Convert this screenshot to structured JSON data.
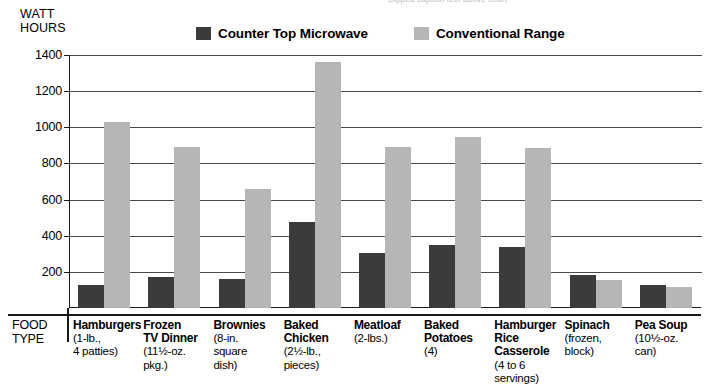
{
  "top_caption": "clipped caption text above chart",
  "axis_title": {
    "line1": "WATT",
    "line2": "HOURS"
  },
  "legend": {
    "entries": [
      {
        "label": "Counter Top Microwave",
        "color": "#3b3b3b",
        "key": "microwave"
      },
      {
        "label": "Conventional Range",
        "color": "#b6b6b6",
        "key": "range"
      }
    ]
  },
  "yaxis": {
    "ticks": [
      "1400",
      "1200",
      "1000",
      "800",
      "600",
      "400",
      "200"
    ],
    "min": 0,
    "max": 1400
  },
  "xaxis": {
    "corner_line1": "FOOD",
    "corner_line2": "TYPE"
  },
  "chart_data": {
    "type": "bar",
    "title": "WATT HOURS",
    "xlabel": "FOOD TYPE",
    "ylabel": "WATT HOURS",
    "ylim": [
      0,
      1400
    ],
    "grid": true,
    "legend_position": "top",
    "categories": [
      "Hamburgers",
      "Frozen TV Dinner",
      "Brownies",
      "Baked Chicken",
      "Meatloaf",
      "Baked Potatoes",
      "Hamburger Rice Casserole",
      "Spinach",
      "Pea Soup"
    ],
    "category_details": [
      {
        "name": "Hamburgers",
        "sub": [
          "(1-lb.,",
          "4 patties)"
        ]
      },
      {
        "name": "Frozen",
        "name2": "TV Dinner",
        "sub": [
          "(11½-oz.",
          "pkg.)"
        ]
      },
      {
        "name": "Brownies",
        "sub": [
          "(8-in.",
          "square",
          "dish)"
        ]
      },
      {
        "name": "Baked",
        "name2": "Chicken",
        "sub": [
          "(2½-lb.,",
          "pieces)"
        ]
      },
      {
        "name": "Meatloaf",
        "sub": [
          "(2-lbs.)"
        ]
      },
      {
        "name": "Baked",
        "name2": "Potatoes",
        "sub": [
          "(4)"
        ]
      },
      {
        "name": "Hamburger",
        "name2": "Rice",
        "name3": "Casserole",
        "sub": [
          "(4 to 6",
          "servings)"
        ]
      },
      {
        "name": "Spinach",
        "sub": [
          "(frozen,",
          "block)"
        ]
      },
      {
        "name": "Pea Soup",
        "sub": [
          "(10½-oz.",
          "can)"
        ]
      }
    ],
    "series": [
      {
        "name": "Counter Top Microwave",
        "color": "#3b3b3b",
        "values": [
          130,
          170,
          160,
          475,
          305,
          350,
          335,
          180,
          130
        ]
      },
      {
        "name": "Conventional Range",
        "color": "#b6b6b6",
        "values": [
          1030,
          890,
          660,
          1360,
          890,
          945,
          885,
          155,
          115
        ]
      }
    ]
  }
}
